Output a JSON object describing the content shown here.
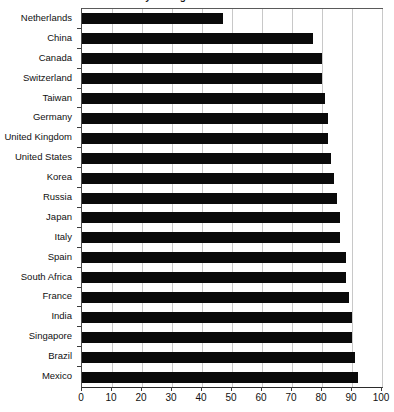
{
  "chart_data": {
    "type": "bar",
    "orientation": "horizontal",
    "title": "y During Retirement",
    "xlabel": "",
    "ylabel": "",
    "xlim": [
      0,
      100
    ],
    "xticks": [
      0,
      10,
      20,
      30,
      40,
      50,
      60,
      70,
      80,
      90,
      100
    ],
    "grid": true,
    "legend": false,
    "bar_color": "#0a0a0a",
    "categories": [
      "Netherlands",
      "China",
      "Canada",
      "Switzerland",
      "Taiwan",
      "Germany",
      "United Kingdom",
      "United States",
      "Korea",
      "Russia",
      "Japan",
      "Italy",
      "Spain",
      "South Africa",
      "France",
      "India",
      "Singapore",
      "Brazil",
      "Mexico"
    ],
    "values": [
      47,
      77,
      80,
      80,
      81,
      82,
      82,
      83,
      84,
      85,
      86,
      86,
      88,
      88,
      89,
      90,
      90,
      91,
      92
    ]
  },
  "axis": {
    "tick_labels": [
      "0",
      "10",
      "20",
      "30",
      "40",
      "50",
      "60",
      "70",
      "80",
      "90",
      "100"
    ]
  }
}
